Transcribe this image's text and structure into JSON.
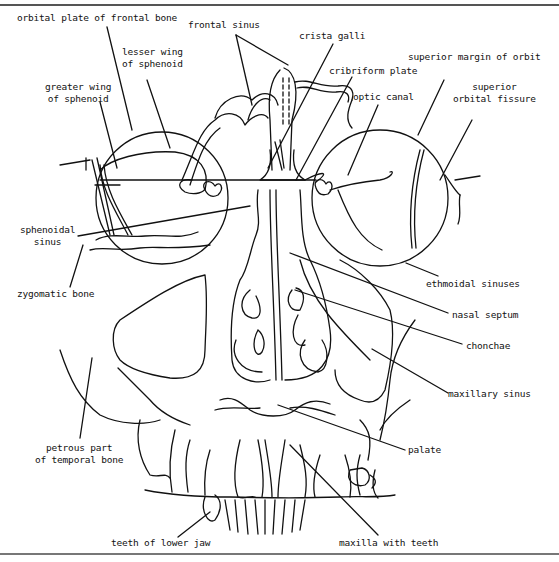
{
  "diagram": {
    "labels": {
      "orbital_plate": "orbital plate of frontal bone",
      "frontal_sinus": "frontal sinus",
      "crista_galli": "crista galli",
      "lesser_wing_1": "lesser wing",
      "lesser_wing_2": "of sphenoid",
      "cribriform_plate": "cribriform plate",
      "superior_margin": "superior margin of orbit",
      "greater_wing_1": "greater wing",
      "greater_wing_2": "of sphenoid",
      "optic_canal": "optic canal",
      "sup_orbital_fissure_1": "superior",
      "sup_orbital_fissure_2": "orbital fissure",
      "sphenoidal_sinus_1": "sphenoidal",
      "sphenoidal_sinus_2": "sinus",
      "zygomatic_bone": "zygomatic bone",
      "ethmoidal_sinuses": "ethmoidal sinuses",
      "nasal_septum": "nasal septum",
      "chonchae": "chonchae",
      "maxillary_sinus": "maxillary sinus",
      "petrous_part_1": "petrous part",
      "petrous_part_2": "of temporal bone",
      "palate": "palate",
      "teeth_lower_jaw": "teeth of lower jaw",
      "maxilla_teeth": "maxilla with teeth"
    }
  }
}
